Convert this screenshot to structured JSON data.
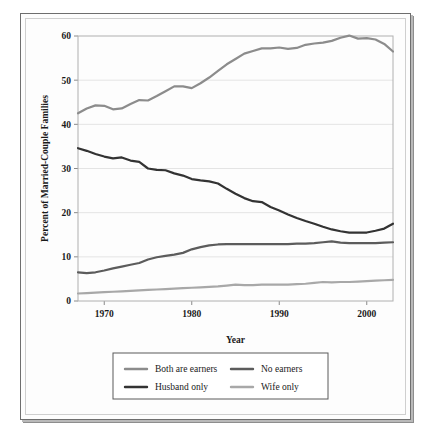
{
  "chart_data": {
    "type": "line",
    "title": "",
    "xlabel": "Year",
    "ylabel": "Percent of Married-Couple Families",
    "xlim": [
      1967,
      2003
    ],
    "ylim": [
      0,
      60
    ],
    "xticks": [
      1970,
      1980,
      1990,
      2000
    ],
    "yticks": [
      0,
      10,
      20,
      30,
      40,
      50,
      60
    ],
    "grid": true,
    "legend_position": "bottom",
    "x": [
      1967,
      1968,
      1969,
      1970,
      1971,
      1972,
      1973,
      1974,
      1975,
      1976,
      1977,
      1978,
      1979,
      1980,
      1981,
      1982,
      1983,
      1984,
      1985,
      1986,
      1987,
      1988,
      1989,
      1990,
      1991,
      1992,
      1993,
      1994,
      1995,
      1996,
      1997,
      1998,
      1999,
      2000,
      2001,
      2002,
      2003
    ],
    "series": [
      {
        "name": "Both are earners",
        "color": "#8c8c8c",
        "width": 2.2,
        "values": [
          42.5,
          43.6,
          44.3,
          44.2,
          43.4,
          43.6,
          44.6,
          45.5,
          45.4,
          46.4,
          47.5,
          48.6,
          48.6,
          48.2,
          49.3,
          50.6,
          52.1,
          53.6,
          54.8,
          56.0,
          56.6,
          57.2,
          57.2,
          57.4,
          57.1,
          57.3,
          58.0,
          58.3,
          58.5,
          58.9,
          59.6,
          60.1,
          59.4,
          59.5,
          59.2,
          58.2,
          56.5
        ]
      },
      {
        "name": "Husband only",
        "color": "#333333",
        "width": 2.2,
        "values": [
          34.6,
          34.0,
          33.3,
          32.7,
          32.3,
          32.5,
          31.8,
          31.5,
          30.0,
          29.7,
          29.6,
          28.9,
          28.4,
          27.6,
          27.3,
          27.1,
          26.6,
          25.4,
          24.3,
          23.3,
          22.6,
          22.4,
          21.3,
          20.5,
          19.6,
          18.8,
          18.1,
          17.5,
          16.8,
          16.2,
          15.8,
          15.5,
          15.5,
          15.5,
          15.9,
          16.4,
          17.5
        ]
      },
      {
        "name": "No earners",
        "color": "#5c5c5c",
        "width": 2.2,
        "values": [
          6.5,
          6.3,
          6.5,
          6.9,
          7.4,
          7.8,
          8.2,
          8.6,
          9.4,
          9.9,
          10.2,
          10.5,
          10.9,
          11.7,
          12.2,
          12.6,
          12.8,
          12.9,
          12.9,
          12.9,
          12.9,
          12.9,
          12.9,
          12.9,
          12.9,
          13.0,
          13.0,
          13.1,
          13.3,
          13.5,
          13.2,
          13.1,
          13.1,
          13.1,
          13.1,
          13.2,
          13.3
        ]
      },
      {
        "name": "Wife only",
        "color": "#a8a8a8",
        "width": 2.2,
        "values": [
          1.7,
          1.8,
          1.9,
          2.0,
          2.1,
          2.2,
          2.3,
          2.4,
          2.5,
          2.6,
          2.7,
          2.8,
          2.9,
          3.0,
          3.1,
          3.2,
          3.3,
          3.5,
          3.7,
          3.6,
          3.6,
          3.7,
          3.7,
          3.7,
          3.7,
          3.8,
          3.9,
          4.1,
          4.3,
          4.2,
          4.3,
          4.3,
          4.4,
          4.5,
          4.6,
          4.7,
          4.8
        ]
      }
    ]
  },
  "legend": {
    "entries": [
      {
        "label": "Both are earners",
        "color": "#8c8c8c"
      },
      {
        "label": "No earners",
        "color": "#5c5c5c"
      },
      {
        "label": "Husband only",
        "color": "#333333"
      },
      {
        "label": "Wife only",
        "color": "#a8a8a8"
      }
    ]
  },
  "axes": {
    "y_title": "Percent of Married-Couple Families",
    "x_title": "Year",
    "y_tick_labels": [
      "0",
      "10",
      "20",
      "30",
      "40",
      "50",
      "60"
    ],
    "x_tick_labels": [
      "1970",
      "1980",
      "1990",
      "2000"
    ]
  }
}
